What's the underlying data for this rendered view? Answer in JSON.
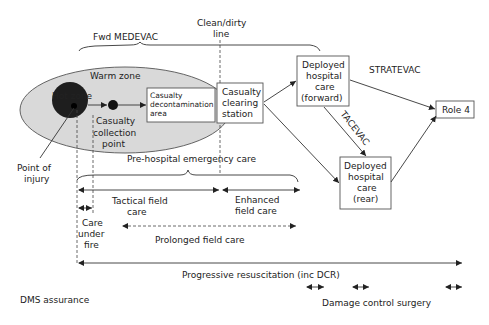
{
  "diagram": {
    "labels": {
      "fwd_medevac": "Fwd MEDEVAC",
      "clean_dirty_1": "Clean/dirty",
      "clean_dirty_2": "line",
      "warm_zone": "Warm zone",
      "hot_zone": "Hot zone",
      "ccp_1": "Casualty",
      "ccp_2": "collection",
      "ccp_3": "point",
      "point_injury_1": "Point of",
      "point_injury_2": "injury",
      "stratevac": "STRATEVAC",
      "tacevac": "TACEVAC",
      "pre_hospital": "Pre-hospital emergency care",
      "tactical_1": "Tactical field",
      "tactical_2": "care",
      "enhanced_1": "Enhanced",
      "enhanced_2": "field care",
      "cuf_1": "Care",
      "cuf_2": "under",
      "cuf_3": "fire",
      "prolonged": "Prolonged field care",
      "progressive": "Progressive resuscitation (inc DCR)",
      "dms": "DMS assurance",
      "dcs": "Damage control surgery"
    },
    "boxes": {
      "decon_1": "Casualty",
      "decon_2": "decontamination",
      "decon_3": "area",
      "ccs_1": "Casualty",
      "ccs_2": "clearing",
      "ccs_3": "station",
      "fwd_1": "Deployed",
      "fwd_2": "hospital",
      "fwd_3": "care",
      "fwd_4": "(forward)",
      "rear_1": "Deployed",
      "rear_2": "hospital",
      "rear_3": "care",
      "rear_4": "(rear)",
      "role4": "Role 4"
    },
    "colors": {
      "warm_zone_fill": "#d9d9d9",
      "hot_zone_fill": "#1e1e1e",
      "line": "#333333"
    }
  }
}
